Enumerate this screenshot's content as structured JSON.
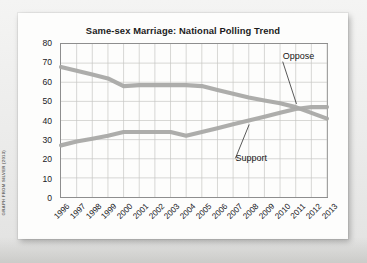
{
  "figure": {
    "source_credit": "GRAPH FROM SILVER (2013)"
  },
  "annotations": {
    "oppose_label": "Oppose",
    "support_label": "Support"
  },
  "chart_data": {
    "type": "line",
    "title": "Same-sex Marriage: National Polling Trend",
    "xlabel": "",
    "ylabel": "",
    "ylim": [
      0,
      80
    ],
    "yticks": [
      0,
      10,
      20,
      30,
      40,
      50,
      60,
      70,
      80
    ],
    "grid": true,
    "legend_position": "inline-annotations",
    "categories": [
      "1996",
      "1997",
      "1998",
      "1999",
      "2000",
      "2001",
      "2002",
      "2003",
      "2004",
      "2005",
      "2006",
      "2007",
      "2008",
      "2009",
      "2010",
      "2011",
      "2012",
      "2013"
    ],
    "series": [
      {
        "name": "Oppose",
        "color": "#a9a9a7",
        "values": [
          68,
          66,
          64,
          62,
          58,
          58.5,
          58.5,
          58.5,
          58.5,
          58,
          56,
          54,
          52,
          50.5,
          49,
          47,
          44,
          41
        ]
      },
      {
        "name": "Support",
        "color": "#a9a9a7",
        "values": [
          27,
          29,
          30.5,
          32,
          34,
          34,
          34,
          34,
          32,
          34,
          36,
          38,
          40,
          42,
          44,
          46,
          47,
          47
        ]
      }
    ]
  }
}
